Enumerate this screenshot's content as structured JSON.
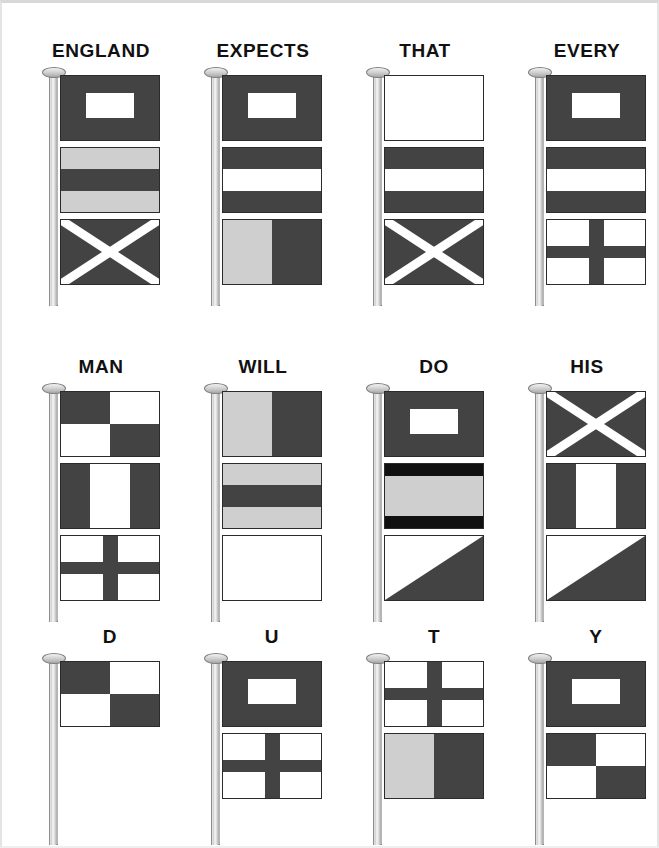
{
  "image": {
    "title": "England Expects That Every Man Will Do His Duty — maritime signal flag hoists",
    "colors": {
      "red": "#434343",
      "yellow": "#cfcfcf",
      "white": "#ffffff",
      "black": "#111111",
      "outline": "#2b2b2b",
      "pole": "#d9d9d9",
      "label": "#111111"
    }
  },
  "rows": [
    {
      "row_index": 0,
      "hoists": [
        {
          "label": "ENGLAND",
          "flags": [
            {
              "letter": "W",
              "pattern": "center-rect",
              "colors": [
                "red",
                "white"
              ]
            },
            {
              "letter": "D",
              "pattern": "horizontal-3",
              "colors": [
                "yellow",
                "red",
                "yellow"
              ]
            },
            {
              "letter": "M",
              "pattern": "saltire",
              "colors": [
                "red",
                "white"
              ]
            }
          ]
        },
        {
          "label": "EXPECTS",
          "flags": [
            {
              "letter": "W",
              "pattern": "center-rect",
              "colors": [
                "red",
                "white"
              ]
            },
            {
              "letter": "C",
              "pattern": "horizontal-3",
              "colors": [
                "red",
                "white",
                "red"
              ]
            },
            {
              "letter": "K",
              "pattern": "vertical-2",
              "colors": [
                "yellow",
                "red"
              ]
            }
          ]
        },
        {
          "label": "THAT",
          "flags": [
            {
              "letter": "P",
              "pattern": "plain",
              "colors": [
                "white"
              ]
            },
            {
              "letter": "C",
              "pattern": "horizontal-3",
              "colors": [
                "red",
                "white",
                "red"
              ]
            },
            {
              "letter": "M",
              "pattern": "saltire",
              "colors": [
                "red",
                "white"
              ]
            }
          ]
        },
        {
          "label": "EVERY",
          "flags": [
            {
              "letter": "W",
              "pattern": "center-rect",
              "colors": [
                "red",
                "white"
              ]
            },
            {
              "letter": "C",
              "pattern": "horizontal-3",
              "colors": [
                "red",
                "white",
                "red"
              ]
            },
            {
              "letter": "T",
              "pattern": "cross",
              "colors": [
                "white",
                "red"
              ]
            }
          ]
        }
      ]
    },
    {
      "row_index": 1,
      "hoists": [
        {
          "label": "MAN",
          "flags": [
            {
              "letter": "U",
              "pattern": "quartered",
              "colors": [
                "red",
                "white"
              ]
            },
            {
              "letter": "H",
              "pattern": "vertical-3",
              "colors": [
                "red",
                "white",
                "red"
              ]
            },
            {
              "letter": "T",
              "pattern": "cross",
              "colors": [
                "white",
                "red"
              ]
            }
          ]
        },
        {
          "label": "WILL",
          "flags": [
            {
              "letter": "K",
              "pattern": "vertical-2",
              "colors": [
                "yellow",
                "red"
              ]
            },
            {
              "letter": "D",
              "pattern": "horizontal-3",
              "colors": [
                "yellow",
                "red",
                "yellow"
              ]
            },
            {
              "letter": "P",
              "pattern": "plain",
              "colors": [
                "white"
              ]
            }
          ]
        },
        {
          "label": "DO",
          "flags": [
            {
              "letter": "W",
              "pattern": "center-rect",
              "colors": [
                "red",
                "white"
              ]
            },
            {
              "letter": "O",
              "pattern": "horizontal-3",
              "colors": [
                "black",
                "yellow",
                "black"
              ]
            },
            {
              "letter": "E",
              "pattern": "diagonal",
              "colors": [
                "white",
                "red"
              ]
            }
          ]
        },
        {
          "label": "HIS",
          "flags": [
            {
              "letter": "M",
              "pattern": "saltire",
              "colors": [
                "red",
                "white"
              ]
            },
            {
              "letter": "H",
              "pattern": "vertical-3",
              "colors": [
                "red",
                "white",
                "red"
              ]
            },
            {
              "letter": "E",
              "pattern": "diagonal",
              "colors": [
                "white",
                "red"
              ]
            }
          ]
        }
      ]
    },
    {
      "row_index": 2,
      "hoists": [
        {
          "label": "D",
          "flags": [
            {
              "letter": "U",
              "pattern": "quartered",
              "colors": [
                "red",
                "white"
              ]
            }
          ]
        },
        {
          "label": "U",
          "flags": [
            {
              "letter": "W",
              "pattern": "center-rect",
              "colors": [
                "red",
                "white"
              ]
            },
            {
              "letter": "T",
              "pattern": "cross",
              "colors": [
                "white",
                "red"
              ]
            }
          ]
        },
        {
          "label": "T",
          "flags": [
            {
              "letter": "T",
              "pattern": "cross",
              "colors": [
                "white",
                "red"
              ]
            },
            {
              "letter": "K",
              "pattern": "vertical-2",
              "colors": [
                "yellow",
                "red"
              ]
            }
          ]
        },
        {
          "label": "Y",
          "flags": [
            {
              "letter": "W",
              "pattern": "center-rect",
              "colors": [
                "red",
                "white"
              ]
            },
            {
              "letter": "U",
              "pattern": "quartered",
              "colors": [
                "red",
                "white"
              ]
            }
          ]
        }
      ]
    }
  ]
}
